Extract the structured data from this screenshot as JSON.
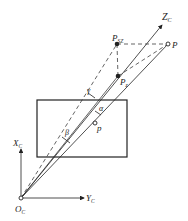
{
  "diagram": {
    "labels": {
      "zc": "Z",
      "zc_sub": "C",
      "xc": "X",
      "xc_sub": "C",
      "yc": "Y",
      "yc_sub": "C",
      "oc": "O",
      "oc_sub": "C",
      "psz": "P",
      "psz_sub": "SZ",
      "p_world": "P",
      "pz": "P",
      "pz_sub": "z",
      "p_image": "p",
      "gamma": "γ",
      "alpha": "α",
      "beta": "β"
    },
    "colors": {
      "line": "#222222",
      "background": "#ffffff"
    }
  }
}
